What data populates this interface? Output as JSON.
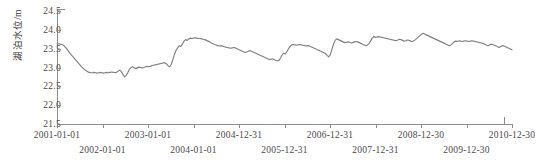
{
  "chart_data": {
    "type": "line",
    "title": "",
    "xlabel": "",
    "ylabel": "湖泊水位/m",
    "ylim": [
      21.5,
      24.5
    ],
    "yticks": [
      "21.5",
      "22.0",
      "22.5",
      "23.0",
      "23.5",
      "24.0",
      "24.5"
    ],
    "ytick_values": [
      21.5,
      22.0,
      22.5,
      23.0,
      23.5,
      24.0,
      24.5
    ],
    "xticks": [
      "2001-01-01",
      "2002-01-01",
      "2003-01-01",
      "2004-01-01",
      "2004-12-31",
      "2005-12-31",
      "2006-12-31",
      "2007-12-31",
      "2008-12-30",
      "2009-12-30",
      "2010-12-30"
    ],
    "grid": false,
    "legend": null,
    "line_color": "#808080",
    "series": [
      {
        "name": "湖泊水位",
        "values": [
          23.63,
          23.63,
          23.62,
          23.61,
          23.59,
          23.55,
          23.5,
          23.44,
          23.38,
          23.33,
          23.28,
          23.23,
          23.18,
          23.13,
          23.08,
          23.03,
          22.99,
          22.95,
          22.92,
          22.89,
          22.87,
          22.86,
          22.86,
          22.87,
          22.86,
          22.85,
          22.86,
          22.87,
          22.86,
          22.85,
          22.86,
          22.87,
          22.86,
          22.87,
          22.88,
          22.87,
          22.86,
          22.87,
          22.9,
          22.93,
          22.89,
          22.81,
          22.75,
          22.79,
          22.86,
          22.95,
          23.0,
          23.02,
          22.99,
          22.97,
          22.99,
          23.01,
          23.0,
          22.99,
          23.0,
          23.02,
          23.03,
          23.02,
          23.03,
          23.05,
          23.06,
          23.07,
          23.08,
          23.09,
          23.1,
          23.11,
          23.12,
          23.13,
          23.1,
          23.05,
          23.02,
          23.08,
          23.2,
          23.34,
          23.45,
          23.52,
          23.58,
          23.56,
          23.62,
          23.7,
          23.74,
          23.72,
          23.76,
          23.78,
          23.77,
          23.78,
          23.79,
          23.78,
          23.77,
          23.77,
          23.76,
          23.75,
          23.74,
          23.72,
          23.7,
          23.68,
          23.65,
          23.63,
          23.61,
          23.6,
          23.58,
          23.57,
          23.58,
          23.57,
          23.55,
          23.54,
          23.53,
          23.52,
          23.51,
          23.52,
          23.53,
          23.52,
          23.5,
          23.48,
          23.46,
          23.44,
          23.42,
          23.4,
          23.41,
          23.43,
          23.45,
          23.43,
          23.41,
          23.39,
          23.37,
          23.35,
          23.33,
          23.31,
          23.29,
          23.27,
          23.25,
          23.23,
          23.21,
          23.22,
          23.23,
          23.21,
          23.19,
          23.18,
          23.19,
          23.25,
          23.33,
          23.38,
          23.36,
          23.42,
          23.5,
          23.56,
          23.6,
          23.61,
          23.6,
          23.59,
          23.6,
          23.61,
          23.6,
          23.59,
          23.58,
          23.57,
          23.58,
          23.57,
          23.55,
          23.53,
          23.51,
          23.49,
          23.47,
          23.45,
          23.43,
          23.41,
          23.39,
          23.37,
          23.32,
          23.28,
          23.34,
          23.48,
          23.62,
          23.72,
          23.76,
          23.74,
          23.72,
          23.7,
          23.68,
          23.66,
          23.67,
          23.68,
          23.67,
          23.65,
          23.66,
          23.68,
          23.69,
          23.68,
          23.66,
          23.64,
          23.62,
          23.6,
          23.58,
          23.6,
          23.63,
          23.7,
          23.78,
          23.82,
          23.8,
          23.81,
          23.82,
          23.81,
          23.8,
          23.79,
          23.78,
          23.77,
          23.76,
          23.75,
          23.74,
          23.73,
          23.72,
          23.71,
          23.73,
          23.75,
          23.74,
          23.72,
          23.7,
          23.71,
          23.73,
          23.72,
          23.7,
          23.69,
          23.71,
          23.74,
          23.78,
          23.82,
          23.86,
          23.89,
          23.91,
          23.88,
          23.86,
          23.84,
          23.82,
          23.8,
          23.78,
          23.76,
          23.74,
          23.72,
          23.7,
          23.68,
          23.66,
          23.64,
          23.62,
          23.6,
          23.58,
          23.6,
          23.64,
          23.68,
          23.7,
          23.69,
          23.71,
          23.7,
          23.69,
          23.7,
          23.71,
          23.7,
          23.69,
          23.7,
          23.71,
          23.7,
          23.69,
          23.68,
          23.67,
          23.66,
          23.65,
          23.64,
          23.62,
          23.6,
          23.58,
          23.6,
          23.62,
          23.61,
          23.59,
          23.57,
          23.55,
          23.53,
          23.56,
          23.58,
          23.57,
          23.55,
          23.53,
          23.51,
          23.49,
          23.47
        ]
      }
    ]
  }
}
